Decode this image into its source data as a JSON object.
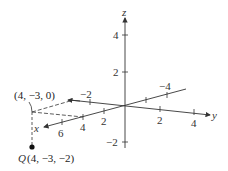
{
  "diagram": {
    "type": "3d-coordinate-axes",
    "axes": {
      "x": {
        "label": "x",
        "ticks": [
          "2",
          "4",
          "6"
        ],
        "negative_ticks": [
          "-4"
        ]
      },
      "y": {
        "label": "y",
        "ticks": [
          "2",
          "4"
        ],
        "negative_ticks": [
          "-2"
        ]
      },
      "z": {
        "label": "z",
        "ticks": [
          "4",
          "2"
        ],
        "negative_ticks": [
          "-2"
        ]
      }
    },
    "points": [
      {
        "name": "projection",
        "label": "(4, −3, 0)"
      },
      {
        "name": "Q",
        "letter": "Q",
        "label": "(4, −3, −2)"
      }
    ],
    "tick_labels": {
      "z_4": "4",
      "z_2": "2",
      "z_neg2": "−2",
      "y_2": "2",
      "y_4": "4",
      "y_neg2": "−2",
      "x_2": "2",
      "x_4": "4",
      "x_6": "6",
      "x_neg4": "−4"
    },
    "colors": {
      "axis": "#333333",
      "point": "#111111",
      "background": "#ffffff"
    }
  }
}
